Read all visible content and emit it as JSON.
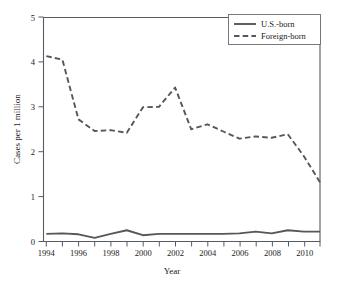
{
  "chart_data": {
    "type": "line",
    "title": "",
    "xlabel": "Year",
    "ylabel": "Cases per 1 million",
    "xlim": [
      1994,
      2011
    ],
    "ylim": [
      0,
      5
    ],
    "grid": false,
    "legend_position": "top-right",
    "x": [
      1994,
      1995,
      1996,
      1997,
      1998,
      1999,
      2000,
      2001,
      2002,
      2003,
      2004,
      2005,
      2006,
      2007,
      2008,
      2009,
      2010,
      2011
    ],
    "x_tick_labels": [
      "1994",
      "1996",
      "1998",
      "2000",
      "2002",
      "2004",
      "2006",
      "2008",
      "2010"
    ],
    "x_tick_values": [
      1994,
      1996,
      1998,
      2000,
      2002,
      2004,
      2006,
      2008,
      2010
    ],
    "x_minor_tick_values": [
      1995,
      1997,
      1999,
      2001,
      2003,
      2005,
      2007,
      2009,
      2011
    ],
    "y_tick_labels": [
      "0",
      "1",
      "2",
      "3",
      "4",
      "5"
    ],
    "y_tick_values": [
      0,
      1,
      2,
      3,
      4,
      5
    ],
    "series": [
      {
        "name": "U.S.-born",
        "style": "solid",
        "color": "#56565e",
        "values": [
          0.17,
          0.18,
          0.16,
          0.08,
          0.17,
          0.25,
          0.14,
          0.17,
          0.17,
          0.17,
          0.17,
          0.17,
          0.18,
          0.22,
          0.18,
          0.25,
          0.22,
          0.22
        ]
      },
      {
        "name": "Foreign-born",
        "style": "dashed",
        "color": "#56565e",
        "values": [
          4.13,
          4.05,
          3.85,
          2.72,
          2.46,
          2.48,
          2.48,
          2.42,
          2.62,
          2.99,
          3.0,
          3.0,
          3.43,
          2.5,
          2.56,
          2.61,
          2.45,
          2.29
        ]
      }
    ],
    "series_full": [
      {
        "name": "Foreign-born",
        "years": [
          1994,
          1995,
          1996,
          1997,
          1998,
          1999,
          2000,
          2001,
          2002,
          2003,
          2004,
          2005,
          2006,
          2007,
          2008,
          2009,
          2010,
          2011
        ],
        "values": [
          4.13,
          4.05,
          2.72,
          2.46,
          2.48,
          2.42,
          2.99,
          3.0,
          3.43,
          2.5,
          2.61,
          2.45,
          2.29,
          2.34,
          2.31,
          2.39,
          1.9,
          1.32
        ]
      },
      {
        "name": "U.S.-born",
        "years": [
          1994,
          1995,
          1996,
          1997,
          1998,
          1999,
          2000,
          2001,
          2002,
          2003,
          2004,
          2005,
          2006,
          2007,
          2008,
          2009,
          2010,
          2011
        ],
        "values": [
          0.17,
          0.18,
          0.16,
          0.08,
          0.17,
          0.25,
          0.14,
          0.17,
          0.17,
          0.17,
          0.17,
          0.17,
          0.18,
          0.22,
          0.18,
          0.25,
          0.22,
          0.22
        ]
      }
    ],
    "legend": [
      {
        "label": "U.S.-born",
        "style": "solid"
      },
      {
        "label": "Foreign-born",
        "style": "dashed"
      }
    ]
  },
  "axes": {
    "x_title": "Year",
    "y_title": "Cases per 1 million",
    "y_ticks": [
      "0",
      "1",
      "2",
      "3",
      "4",
      "5"
    ],
    "x_ticks": [
      "1994",
      "1996",
      "1998",
      "2000",
      "2002",
      "2004",
      "2006",
      "2008",
      "2010"
    ]
  },
  "legend": {
    "items": [
      {
        "label": "U.S.-born"
      },
      {
        "label": "Foreign-born"
      }
    ]
  },
  "colors": {
    "line": "#56565e",
    "axis": "#5a5a62",
    "text": "#1a1a1a",
    "background": "#ffffff"
  }
}
